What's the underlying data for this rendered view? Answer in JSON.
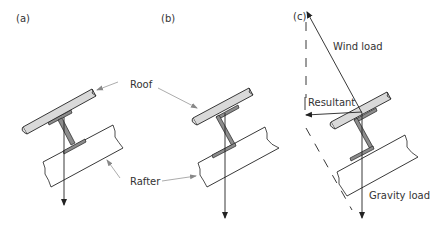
{
  "panels": [
    {
      "label": "(a)",
      "section": "I-section purlin"
    },
    {
      "label": "(b)",
      "section": "Z-section purlin"
    },
    {
      "label": "(c)",
      "section": "Z-section purlin with load vectors"
    }
  ],
  "annotations": {
    "roof": "Roof",
    "rafter": "Rafter",
    "wind_load": "Wind load",
    "resultant": "Resultant",
    "gravity_load": "Gravity load"
  },
  "colors": {
    "line": "#222222",
    "roof_fill": "#d9d9d9",
    "section_fill": "#8c8c8c",
    "leader": "#888888"
  }
}
